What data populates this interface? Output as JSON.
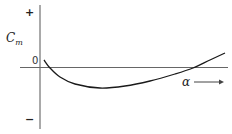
{
  "chart_data": {
    "type": "line",
    "title": "",
    "xlabel": "α",
    "ylabel": "C_m",
    "x_axis_direction_arrow": true,
    "y_axis_markers": [
      "+",
      "0",
      "-"
    ],
    "grid": false,
    "legend": null,
    "series": [
      {
        "name": "C_m vs α",
        "description": "Qualitative curve: starts slightly positive just right of origin, drops to a negative minimum, then rises back, crossing zero and becoming positive at high α",
        "points_px": [
          [
            44,
            60
          ],
          [
            50,
            68
          ],
          [
            60,
            77
          ],
          [
            75,
            84
          ],
          [
            100,
            88
          ],
          [
            125,
            86
          ],
          [
            150,
            81
          ],
          [
            175,
            74
          ],
          [
            193,
            68
          ],
          [
            210,
            60
          ],
          [
            225,
            53
          ]
        ]
      }
    ],
    "colors": {
      "axis": "#555555",
      "curve": "#1a1a1a",
      "background": "#ffffff"
    }
  },
  "labels": {
    "plus": "+",
    "minus": "−",
    "cm_main": "C",
    "cm_sub": "m",
    "zero": "0",
    "alpha": "α"
  }
}
